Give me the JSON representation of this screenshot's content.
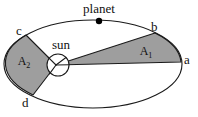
{
  "figure": {
    "background_color": "#ffffff",
    "stroke_color": "#1a1a1a",
    "sector_fill_color": "#9e9e9e",
    "sun_fill_color": "#ffffff",
    "planet_dot_color": "#000000"
  },
  "labels": {
    "planet": "planet",
    "sun": "sun",
    "point_a": "a",
    "point_b": "b",
    "point_c": "c",
    "point_d": "d",
    "area_one": "A",
    "area_one_sub": "1",
    "area_two": "A",
    "area_two_sub": "2"
  },
  "geometry": {
    "ellipse": {
      "cx": 93,
      "cy": 64,
      "rx": 89,
      "ry": 44
    },
    "sun_circle": {
      "cx": 58,
      "cy": 65,
      "r": 11
    },
    "focus": {
      "x": 56,
      "y": 65
    },
    "planet_dot": {
      "cx": 99,
      "cy": 21,
      "r": 3
    },
    "point_a": {
      "x": 181,
      "y": 62
    },
    "point_b": {
      "x": 155,
      "y": 33
    },
    "point_c": {
      "x": 26,
      "y": 35
    },
    "point_d": {
      "x": 33,
      "y": 95
    }
  }
}
